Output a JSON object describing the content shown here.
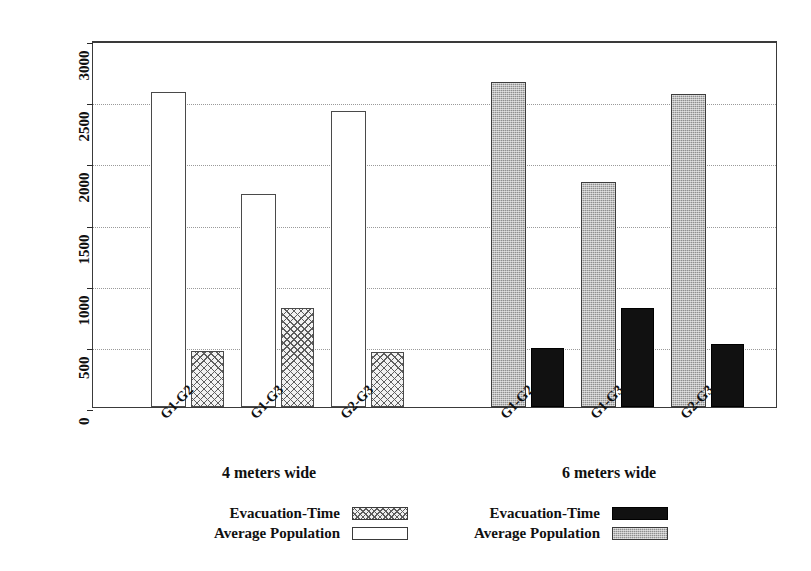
{
  "chart_data": {
    "type": "bar",
    "title": "",
    "subtitle": "",
    "xlabel": "",
    "ylabel": "Population/Evacuation-Time",
    "ylim": [
      0,
      3000
    ],
    "ytick_labels": [
      "3000",
      "2500",
      "2000",
      "1500",
      "1000",
      "500",
      "0"
    ],
    "ytick_values": [
      3000,
      2500,
      2000,
      1500,
      1000,
      500,
      0
    ],
    "grid": true,
    "grid_axis": "y",
    "grid_style": "dotted",
    "legend_position": "bottom",
    "categories": [
      "G1-G2",
      "G1-G3",
      "G2-G3"
    ],
    "groups": [
      {
        "name": "4 meters wide",
        "categories": [
          "G1-G2",
          "G1-G3",
          "G2-G3"
        ],
        "series": [
          {
            "name": "Average Population",
            "style": "white-outline",
            "values": [
              2574,
              1738,
              2418
            ]
          },
          {
            "name": "Evacuation-Time",
            "style": "cross-hatch",
            "values": [
              455,
              812,
              450
            ]
          }
        ]
      },
      {
        "name": "6 meters wide",
        "categories": [
          "G1-G2",
          "G1-G3",
          "G2-G3"
        ],
        "series": [
          {
            "name": "Average Population",
            "style": "gray-stipple",
            "values": [
              2656,
              1836,
              2557
            ]
          },
          {
            "name": "Evacuation-Time",
            "style": "solid-black",
            "values": [
              483,
              812,
              517
            ]
          }
        ]
      }
    ]
  },
  "axis": {
    "y_title": "Population/Evacuation-Time",
    "ticks": [
      {
        "label": "3000",
        "value": 3000
      },
      {
        "label": "2500",
        "value": 2500
      },
      {
        "label": "2000",
        "value": 2000
      },
      {
        "label": "1500",
        "value": 1500
      },
      {
        "label": "1000",
        "value": 1000
      },
      {
        "label": "500",
        "value": 500
      },
      {
        "label": "0",
        "value": 0
      }
    ]
  },
  "xticks": [
    {
      "label": "G1-G2"
    },
    {
      "label": "G1-G3"
    },
    {
      "label": "G2-G3"
    },
    {
      "label": "G1-G2"
    },
    {
      "label": "G1-G3"
    },
    {
      "label": "G2-G3"
    }
  ],
  "group_labels": [
    {
      "label": "4 meters wide"
    },
    {
      "label": "6 meters wide"
    }
  ],
  "legend_left": {
    "rows": [
      {
        "label": "Evacuation-Time",
        "swatch": "cross-hatch"
      },
      {
        "label": "Average Population",
        "swatch": "white-outline"
      }
    ]
  },
  "legend_right": {
    "rows": [
      {
        "label": "Evacuation-Time",
        "swatch": "solid-black"
      },
      {
        "label": "Average Population",
        "swatch": "gray-stipple"
      }
    ]
  },
  "colors": {
    "background": "#ffffff",
    "axis": "#3a3a3a",
    "grid": "#9a9a9a",
    "bar_white": "#ffffff",
    "bar_hatch": "#f2f2f2",
    "bar_gray": "#8f8f8f",
    "bar_black": "#111111",
    "text": "#101010"
  }
}
